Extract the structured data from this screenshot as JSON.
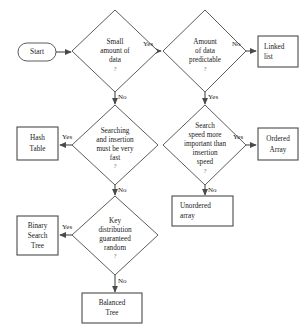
{
  "diagram": {
    "colors": {
      "stroke": "#4a4a4a",
      "fill": "#ffffff",
      "text": "#1a1a1a",
      "question_mark": "#6a6a6a"
    },
    "start": {
      "label": "Start"
    },
    "decisions": [
      {
        "id": "small-amount-of-data",
        "lines": [
          "Small",
          "amount of",
          "data"
        ],
        "question_mark": "?",
        "yes_label": "Yes",
        "no_label": "No"
      },
      {
        "id": "amount-of-data-predictable",
        "lines": [
          "Amount",
          "of data",
          "predictable"
        ],
        "question_mark": "?",
        "yes_label": "Yes",
        "no_label": "No"
      },
      {
        "id": "searching-and-insertion-fast",
        "lines": [
          "Searching",
          "and insertion",
          "must be very",
          "fast"
        ],
        "question_mark": "?",
        "yes_label": "Yes",
        "no_label": "No"
      },
      {
        "id": "search-speed-more-important",
        "lines": [
          "Search",
          "speed more",
          "important than",
          "insertion",
          "speed"
        ],
        "question_mark": "?",
        "yes_label": "Yes",
        "no_label": "No"
      },
      {
        "id": "key-distribution-random",
        "lines": [
          "Key",
          "distribution",
          "guaranteed",
          "random"
        ],
        "question_mark": "?",
        "yes_label": "Yes",
        "no_label": "No"
      }
    ],
    "results": [
      {
        "id": "linked-list",
        "lines": [
          "Linked",
          "list"
        ]
      },
      {
        "id": "hash-table",
        "lines": [
          "Hash",
          "Table"
        ]
      },
      {
        "id": "ordered-array",
        "lines": [
          "Ordered",
          "Array"
        ]
      },
      {
        "id": "unordered-array",
        "lines": [
          "Unordered",
          "array"
        ]
      },
      {
        "id": "binary-search-tree",
        "lines": [
          "Binary",
          "Search",
          "Tree"
        ]
      },
      {
        "id": "balanced-tree",
        "lines": [
          "Balanced",
          "Tree"
        ]
      }
    ]
  }
}
